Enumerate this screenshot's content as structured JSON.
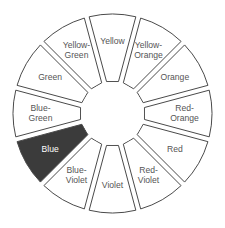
{
  "diagram": {
    "type": "color-wheel",
    "center": [
      112.5,
      113.5
    ],
    "outer_radius": 99.5,
    "inner_radius": 32.5,
    "gap_px": 5,
    "start_angle_deg": -90,
    "colors": {
      "segment_fill": "#ffffff",
      "segment_stroke": "#4a4a4a",
      "text": "#555555",
      "highlight_fill": "#3b3b3b",
      "highlight_text": "#ffffff"
    },
    "segments": [
      {
        "name": "Yellow",
        "lines": [
          "Yellow"
        ],
        "highlighted": false
      },
      {
        "name": "Yellow-Orange",
        "lines": [
          "Yellow-",
          "Orange"
        ],
        "highlighted": false
      },
      {
        "name": "Orange",
        "lines": [
          "Orange"
        ],
        "highlighted": false
      },
      {
        "name": "Red-Orange",
        "lines": [
          "Red-",
          "Orange"
        ],
        "highlighted": false
      },
      {
        "name": "Red",
        "lines": [
          "Red"
        ],
        "highlighted": false
      },
      {
        "name": "Red-Violet",
        "lines": [
          "Red-",
          "Violet"
        ],
        "highlighted": false
      },
      {
        "name": "Violet",
        "lines": [
          "Violet"
        ],
        "highlighted": false
      },
      {
        "name": "Blue-Violet",
        "lines": [
          "Blue-",
          "Violet"
        ],
        "highlighted": false
      },
      {
        "name": "Blue",
        "lines": [
          "Blue"
        ],
        "highlighted": true
      },
      {
        "name": "Blue-Green",
        "lines": [
          "Blue-",
          "Green"
        ],
        "highlighted": false
      },
      {
        "name": "Green",
        "lines": [
          "Green"
        ],
        "highlighted": false
      },
      {
        "name": "Yellow-Green",
        "lines": [
          "Yellow-",
          "Green"
        ],
        "highlighted": false
      }
    ]
  }
}
